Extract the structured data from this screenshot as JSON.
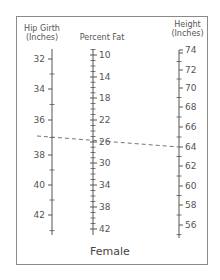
{
  "nomogram": {
    "title": "Female",
    "colors": {
      "line": "#555555",
      "frame": "#8a8a8a",
      "dashed": "#666666"
    },
    "scales": [
      {
        "id": "hip",
        "header_line1": "Hip Girth",
        "header_line2": "(Inches)",
        "label_side": "left",
        "major": [
          {
            "label": "32",
            "y": 59
          },
          {
            "label": "34",
            "y": 89
          },
          {
            "label": "36",
            "y": 120
          },
          {
            "label": "38",
            "y": 155
          },
          {
            "label": "40",
            "y": 185
          },
          {
            "label": "42",
            "y": 215
          }
        ]
      },
      {
        "id": "fat",
        "header_line1": "Percent Fat",
        "header_line2": "",
        "label_side": "right",
        "major": [
          {
            "label": "10",
            "y": 55
          },
          {
            "label": "14",
            "y": 77
          },
          {
            "label": "18",
            "y": 98
          },
          {
            "label": "22",
            "y": 120
          },
          {
            "label": "26",
            "y": 142
          },
          {
            "label": "30",
            "y": 163
          },
          {
            "label": "34",
            "y": 185
          },
          {
            "label": "38",
            "y": 207
          },
          {
            "label": "42",
            "y": 229
          }
        ]
      },
      {
        "id": "height",
        "header_line1": "Height",
        "header_line2": "(Inches)",
        "label_side": "right",
        "major": [
          {
            "label": "74",
            "y": 53
          },
          {
            "label": "72",
            "y": 70
          },
          {
            "label": "70",
            "y": 88
          },
          {
            "label": "68",
            "y": 107
          },
          {
            "label": "66",
            "y": 127
          },
          {
            "label": "64",
            "y": 147
          },
          {
            "label": "62",
            "y": 166
          },
          {
            "label": "60",
            "y": 186
          },
          {
            "label": "58",
            "y": 205
          },
          {
            "label": "56",
            "y": 225
          }
        ]
      }
    ],
    "example_line": {
      "from": {
        "scale": "hip",
        "value": "37"
      },
      "through": {
        "scale": "fat",
        "value": "26"
      },
      "to": {
        "scale": "height",
        "value": "64"
      }
    }
  }
}
